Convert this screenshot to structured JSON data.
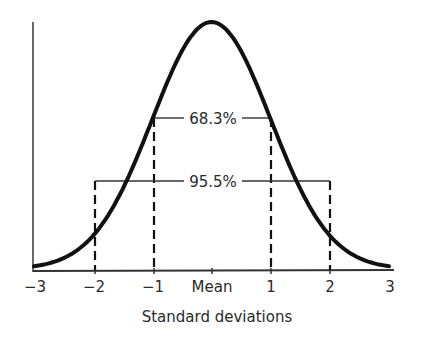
{
  "chart_data": {
    "type": "line",
    "title": "",
    "xlabel": "Standard deviations",
    "ylabel": "",
    "x_ticks": [
      "-3",
      "-2",
      "-1",
      "Mean",
      "1",
      "2",
      "3"
    ],
    "x_tick_values": [
      -3,
      -2,
      -1,
      0,
      1,
      2,
      3
    ],
    "xlim": [
      -3,
      3
    ],
    "grid": false,
    "legend": null,
    "series": [
      {
        "name": "Normal distribution",
        "x": [
          -3,
          -2.5,
          -2,
          -1.5,
          -1,
          -0.5,
          0,
          0.5,
          1,
          1.5,
          2,
          2.5,
          3
        ],
        "values": [
          0.004,
          0.018,
          0.054,
          0.13,
          0.242,
          0.352,
          0.399,
          0.352,
          0.242,
          0.13,
          0.054,
          0.018,
          0.004
        ]
      }
    ],
    "annotations": [
      {
        "label": "68.3%",
        "range": [
          -1,
          1
        ]
      },
      {
        "label": "95.5%",
        "range": [
          -2,
          2
        ]
      }
    ]
  },
  "labels": {
    "xlabel": "Standard deviations",
    "ticks": [
      "−3",
      "−2",
      "−1",
      "Mean",
      "1",
      "2",
      "3"
    ],
    "band_1sd": "68.3%",
    "band_2sd": "95.5%"
  },
  "colors": {
    "curve": "#111111",
    "axis": "#333333",
    "text": "#2a2a2a"
  }
}
